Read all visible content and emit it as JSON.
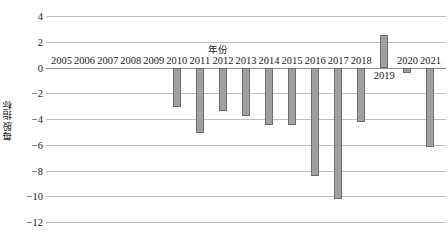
{
  "chart_data": {
    "type": "bar",
    "title": "",
    "xlabel": "年份",
    "ylabel": "每股指标",
    "categories": [
      "2005",
      "2006",
      "2007",
      "2008",
      "2009",
      "2010",
      "2011",
      "2012",
      "2013",
      "2014",
      "2015",
      "2016",
      "2017",
      "2018",
      "2019",
      "2020",
      "2021"
    ],
    "values": [
      0,
      0,
      0,
      0,
      0,
      -3.1,
      -5.1,
      -3.4,
      -3.8,
      -4.5,
      -4.5,
      -8.4,
      -10.2,
      -4.2,
      2.5,
      -0.4,
      -6.2
    ],
    "series": [
      {
        "name": "每股指标",
        "values": [
          0,
          0,
          0,
          0,
          0,
          -3.1,
          -5.1,
          -3.4,
          -3.8,
          -4.5,
          -4.5,
          -8.4,
          -10.2,
          -4.2,
          2.5,
          -0.4,
          -6.2
        ]
      }
    ],
    "ylim": [
      -12,
      4
    ],
    "ytick_labels": [
      "4",
      "2",
      "0",
      "-2",
      "-4",
      "-6",
      "-8",
      "-10",
      "-12"
    ],
    "ytick_values": [
      4,
      2,
      0,
      -2,
      -4,
      -6,
      -8,
      -10,
      -12
    ],
    "grid": true,
    "legend": "none",
    "bar_color": "#a0a0a0",
    "bar_border_color": "#6e6e6e",
    "gridline_color": "#bfbfbf",
    "axis_color": "#8c8c8c",
    "text_color": "#1a1a1a",
    "xlabel_position": "top-center",
    "xtick_baseline_value": 0,
    "xtick_offset_categories": [
      "2019"
    ]
  }
}
